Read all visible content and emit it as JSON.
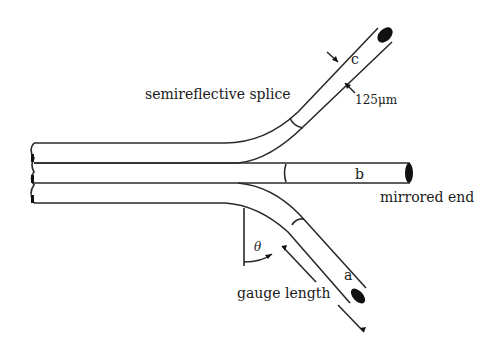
{
  "diagram": {
    "labels": {
      "splice": "semireflective splice",
      "diameter": "125μm",
      "fiber_c": "c",
      "fiber_b": "b",
      "fiber_a": "a",
      "mirrored_end": "mirrored end",
      "angle": "θ",
      "gauge_length": "gauge length"
    },
    "colors": {
      "line": "#2a2a2a",
      "background": "#ffffff"
    }
  }
}
